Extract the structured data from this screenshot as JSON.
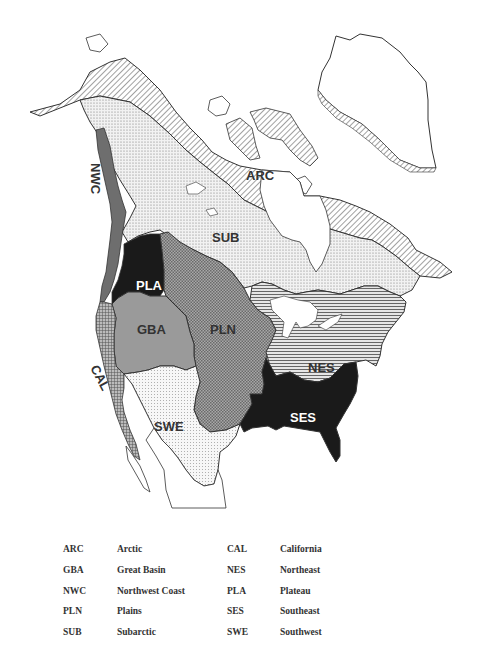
{
  "map": {
    "title": "Culture areas of North America",
    "labels": {
      "ARC": "ARC",
      "SUB": "SUB",
      "NWC": "NWC",
      "PLA": "PLA",
      "GBA": "GBA",
      "PLN": "PLN",
      "CAL": "CAL",
      "SWE": "SWE",
      "NES": "NES",
      "SES": "SES"
    },
    "colors": {
      "outline": "#333333",
      "dark": "#1a1a1a",
      "nwc_gray": "#6e6e6e",
      "gba_gray": "#9a9a9a"
    }
  },
  "legend": {
    "rows": [
      {
        "code1": "ARC",
        "name1": "Arctic",
        "code2": "CAL",
        "name2": "California"
      },
      {
        "code1": "GBA",
        "name1": "Great Basin",
        "code2": "NES",
        "name2": "Northeast"
      },
      {
        "code1": "NWC",
        "name1": "Northwest Coast",
        "code2": "PLA",
        "name2": "Plateau"
      },
      {
        "code1": "PLN",
        "name1": "Plains",
        "code2": "SES",
        "name2": "Southeast"
      },
      {
        "code1": "SUB",
        "name1": "Subarctic",
        "code2": "SWE",
        "name2": "Southwest"
      }
    ]
  }
}
